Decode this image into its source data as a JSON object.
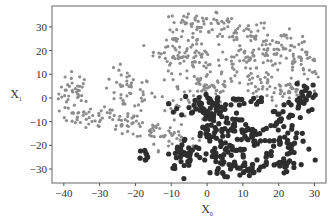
{
  "chart_data": {
    "type": "scatter",
    "title": "",
    "xlabel": "X",
    "xlabel_subscript": "0",
    "ylabel": "X",
    "ylabel_subscript": "1",
    "xlim": [
      -43.3,
      33.2
    ],
    "ylim": [
      -35.9,
      38.8
    ],
    "x_ticks": [
      -40,
      -30,
      -20,
      -10,
      0,
      10,
      20,
      30
    ],
    "y_ticks": [
      -30,
      -20,
      -10,
      0,
      10,
      20,
      30
    ],
    "grid": false,
    "legend": null,
    "series": [
      {
        "name": "light",
        "color": "#8c8c8c",
        "marker_size": 2.6,
        "clusters": [
          {
            "cx": -37,
            "cy": 2,
            "sx": 2.2,
            "sy": 4.5,
            "n": 40
          },
          {
            "cx": -33,
            "cy": -8,
            "sx": 4,
            "sy": 2,
            "n": 30
          },
          {
            "cx": -22,
            "cy": 3,
            "sx": 3.5,
            "sy": 4.5,
            "n": 45
          },
          {
            "cx": -26,
            "cy": -9,
            "sx": 5,
            "sy": 2.5,
            "n": 30
          },
          {
            "cx": -15,
            "cy": -13,
            "sx": 4,
            "sy": 2.5,
            "n": 25
          },
          {
            "cx": -10,
            "cy": -17,
            "sx": 3.5,
            "sy": 2.5,
            "n": 25
          },
          {
            "cx": -8,
            "cy": -3,
            "sx": 2.5,
            "sy": 3,
            "n": 18
          },
          {
            "cx": -9,
            "cy": 21,
            "sx": 3,
            "sy": 4.5,
            "n": 45
          },
          {
            "cx": -2,
            "cy": 32,
            "sx": 5,
            "sy": 1.8,
            "n": 40
          },
          {
            "cx": -4,
            "cy": 15,
            "sx": 4,
            "sy": 4,
            "n": 40
          },
          {
            "cx": 0,
            "cy": 5,
            "sx": 4,
            "sy": 4,
            "n": 45
          },
          {
            "cx": 8,
            "cy": 27,
            "sx": 5,
            "sy": 3,
            "n": 45
          },
          {
            "cx": 12,
            "cy": 15,
            "sx": 5,
            "sy": 4,
            "n": 55
          },
          {
            "cx": 20,
            "cy": 22,
            "sx": 5,
            "sy": 3,
            "n": 45
          },
          {
            "cx": 26,
            "cy": 14,
            "sx": 3,
            "sy": 5,
            "n": 40
          },
          {
            "cx": 15,
            "cy": 3,
            "sx": 6,
            "sy": 3.5,
            "n": 40
          },
          {
            "cx": 24,
            "cy": 3,
            "sx": 3.5,
            "sy": 3,
            "n": 25
          }
        ]
      },
      {
        "name": "dark",
        "color": "#2e2e2e",
        "marker_size": 3.4,
        "clusters": [
          {
            "cx": -17,
            "cy": -24,
            "sx": 1,
            "sy": 1.5,
            "n": 8
          },
          {
            "cx": -6,
            "cy": -24,
            "sx": 2.5,
            "sy": 3.5,
            "n": 40
          },
          {
            "cx": -2,
            "cy": -3,
            "sx": 3,
            "sy": 2.5,
            "n": 30
          },
          {
            "cx": 3,
            "cy": -2,
            "sx": 2,
            "sy": 2,
            "n": 18
          },
          {
            "cx": 0,
            "cy": -12,
            "sx": 1.8,
            "sy": 4.5,
            "n": 30
          },
          {
            "cx": 5,
            "cy": -10,
            "sx": 2,
            "sy": 2,
            "n": 14
          },
          {
            "cx": 3,
            "cy": -25,
            "sx": 1.8,
            "sy": 4.5,
            "n": 30
          },
          {
            "cx": 9,
            "cy": -14,
            "sx": 2.5,
            "sy": 2,
            "n": 20
          },
          {
            "cx": 8,
            "cy": -21,
            "sx": 1.8,
            "sy": 3.5,
            "n": 20
          },
          {
            "cx": 11,
            "cy": -30,
            "sx": 3.5,
            "sy": 1.8,
            "n": 30
          },
          {
            "cx": 14,
            "cy": -18,
            "sx": 2,
            "sy": 2.5,
            "n": 16
          },
          {
            "cx": 14,
            "cy": -2,
            "sx": 1.2,
            "sy": 1.2,
            "n": 6
          },
          {
            "cx": 9,
            "cy": -1,
            "sx": 1.2,
            "sy": 1.2,
            "n": 6
          },
          {
            "cx": 21,
            "cy": -9,
            "sx": 2,
            "sy": 3,
            "n": 20
          },
          {
            "cx": 25,
            "cy": -3,
            "sx": 2,
            "sy": 2,
            "n": 16
          },
          {
            "cx": 28,
            "cy": 3,
            "sx": 1.5,
            "sy": 2.5,
            "n": 12
          },
          {
            "cx": 22,
            "cy": -19,
            "sx": 3,
            "sy": 2.5,
            "n": 28
          },
          {
            "cx": 21,
            "cy": -28,
            "sx": 3.5,
            "sy": 1.5,
            "n": 22
          },
          {
            "cx": 17,
            "cy": -24,
            "sx": 1,
            "sy": 1,
            "n": 4
          }
        ]
      }
    ]
  },
  "axes": {
    "frame": {
      "left": 52,
      "top": 6,
      "right": 326,
      "bottom": 183
    },
    "tick_color": "#555555",
    "frame_color": "#666666"
  }
}
